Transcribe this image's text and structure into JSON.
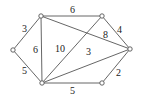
{
  "graph": {
    "type": "weighted-undirected-graph",
    "nodes": [
      {
        "id": "A",
        "x": 13,
        "y": 50
      },
      {
        "id": "B",
        "x": 41,
        "y": 16
      },
      {
        "id": "C",
        "x": 102,
        "y": 16
      },
      {
        "id": "D",
        "x": 130,
        "y": 49
      },
      {
        "id": "E",
        "x": 102,
        "y": 83
      },
      {
        "id": "F",
        "x": 42,
        "y": 83
      }
    ],
    "edges": [
      {
        "from": "A",
        "to": "B",
        "weight": "3",
        "lx": 22,
        "ly": 32
      },
      {
        "from": "A",
        "to": "F",
        "weight": "5",
        "lx": 22,
        "ly": 74
      },
      {
        "from": "B",
        "to": "C",
        "weight": "6",
        "lx": 70,
        "ly": 13
      },
      {
        "from": "B",
        "to": "F",
        "weight": "6",
        "lx": 33,
        "ly": 53
      },
      {
        "from": "B",
        "to": "D",
        "weight": "8",
        "lx": 103,
        "ly": 38
      },
      {
        "from": "C",
        "to": "D",
        "weight": "4",
        "lx": 117,
        "ly": 33
      },
      {
        "from": "C",
        "to": "F",
        "weight": "10",
        "lx": 55,
        "ly": 52
      },
      {
        "from": "F",
        "to": "D",
        "weight": "3",
        "lx": 86,
        "ly": 55
      },
      {
        "from": "F",
        "to": "E",
        "weight": "5",
        "lx": 70,
        "ly": 94
      },
      {
        "from": "E",
        "to": "D",
        "weight": "2",
        "lx": 116,
        "ly": 76
      }
    ]
  }
}
